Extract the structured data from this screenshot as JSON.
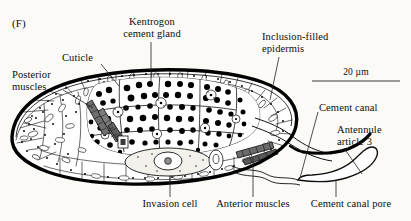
{
  "figure": {
    "panel_letter": "(F)",
    "domain": "biological-micrograph-line-drawing"
  },
  "labels": {
    "kentrogon_cement_gland": "Kentrogon\ncement gland",
    "cuticle": "Cuticle",
    "posterior_muscles": "Posterior\nmuscles",
    "inclusion_filled_epidermis": "Inclusion-filled\nepidermis",
    "cement_canal": "Cement canal",
    "antennule_article_3": "Antennule\narticle 3",
    "invasion_cell": "Invasion cell",
    "anterior_muscles": "Anterior muscles",
    "cement_canal_pore": "Cement canal pore"
  },
  "scalebar": {
    "text": "20 µm",
    "length_px": 88,
    "value": 20,
    "unit": "µm"
  },
  "colors": {
    "background": "#fbfaf7",
    "ink": "#0d0d0d",
    "cuticle_stroke": "#000000",
    "cell_stroke": "#1a1a1a",
    "granule_fill": "#000000",
    "muscle_fill": "#5a5a5a",
    "cytoplasm_fill": "#ffffff",
    "invasion_cell_fill": "#f2f1ec",
    "leader_line": "#222222",
    "scalebar_line": "#3a3a3a"
  }
}
